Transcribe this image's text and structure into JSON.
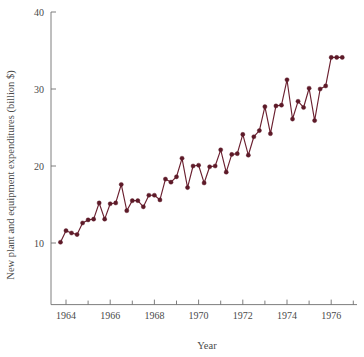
{
  "chart_data": {
    "type": "line",
    "title": "",
    "subtitle": "",
    "xlabel": "Year",
    "ylabel": "New plant and equipment expenditures (billion $)",
    "xlim": [
      1963.5,
      1977.0
    ],
    "ylim": [
      2.0,
      40.0
    ],
    "grid": false,
    "legend": "none",
    "marker": "filled-circle",
    "line_color": "#6b2030",
    "marker_color": "#5d1a28",
    "axis_color": "#6f6f6f",
    "background": "#ffffff",
    "y_ticks": [
      10,
      20,
      30,
      40
    ],
    "y_tick_labels": [
      "10",
      "20",
      "30",
      "40"
    ],
    "x_major_ticks": [
      1964,
      1966,
      1968,
      1970,
      1972,
      1974,
      1976
    ],
    "x_major_tick_labels": [
      "1964",
      "1966",
      "1968",
      "1970",
      "1972",
      "1974",
      "1976"
    ],
    "x_minor_ticks": [
      1965,
      1967,
      1969,
      1971,
      1973,
      1975,
      1977
    ],
    "x_label_note": "quarterly observations, Q1 1964 through Q2 1977",
    "x": [
      1963.75,
      1964.0,
      1964.25,
      1964.5,
      1964.75,
      1965.0,
      1965.25,
      1965.5,
      1965.75,
      1966.0,
      1966.25,
      1966.5,
      1966.75,
      1967.0,
      1967.25,
      1967.5,
      1967.75,
      1968.0,
      1968.25,
      1968.5,
      1968.75,
      1969.0,
      1969.25,
      1969.5,
      1969.75,
      1970.0,
      1970.25,
      1970.5,
      1970.75,
      1971.0,
      1971.25,
      1971.5,
      1971.75,
      1972.0,
      1972.25,
      1972.5,
      1972.75,
      1973.0,
      1973.25,
      1973.5,
      1973.75,
      1974.0,
      1974.25,
      1974.5,
      1974.75,
      1975.0,
      1975.25,
      1975.5,
      1975.75,
      1976.0,
      1976.25,
      1976.5
    ],
    "y": [
      10.1,
      11.6,
      11.3,
      11.1,
      12.6,
      13.0,
      13.1,
      15.2,
      13.1,
      15.1,
      15.2,
      17.6,
      14.2,
      15.5,
      15.5,
      14.7,
      16.2,
      16.2,
      15.6,
      18.3,
      17.9,
      18.6,
      21.0,
      17.2,
      20.0,
      20.1,
      17.8,
      19.9,
      20.0,
      22.1,
      19.2,
      21.5,
      21.6,
      24.1,
      21.4,
      23.8,
      24.6,
      27.7,
      24.2,
      27.8,
      27.9,
      31.2,
      26.1,
      28.4,
      27.6,
      30.1,
      25.9,
      30.0,
      30.4,
      34.1,
      34.1,
      34.1
    ],
    "series": [
      {
        "name": "New plant and equipment expenditures",
        "values": [
          10.1,
          11.6,
          11.3,
          11.1,
          12.6,
          13.0,
          13.1,
          15.2,
          13.1,
          15.1,
          15.2,
          17.6,
          14.2,
          15.5,
          15.5,
          14.7,
          16.2,
          16.2,
          15.6,
          18.3,
          17.9,
          18.6,
          21.0,
          17.2,
          20.0,
          20.1,
          17.8,
          19.9,
          20.0,
          22.1,
          19.2,
          21.5,
          21.6,
          24.1,
          21.4,
          23.8,
          24.6,
          27.7,
          24.2,
          27.8,
          27.9,
          31.2,
          26.1,
          28.4,
          27.6,
          30.1,
          25.9,
          30.0,
          30.4,
          34.1,
          34.1,
          34.1
        ]
      }
    ]
  }
}
